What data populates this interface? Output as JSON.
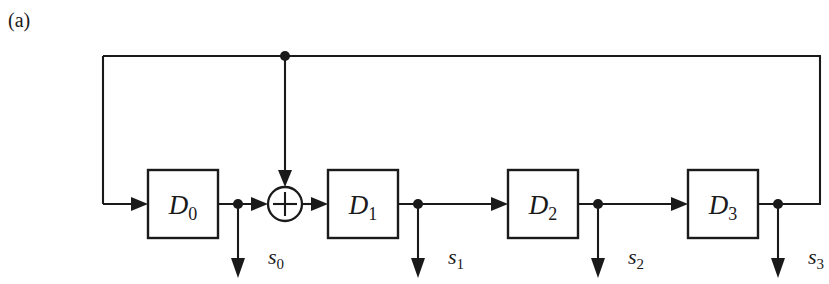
{
  "figure": {
    "caption": "(a)",
    "caption_x": 8,
    "caption_y": 10,
    "width": 829,
    "height": 284,
    "background": "#ffffff",
    "ink_color": "#1a1a1a",
    "type": "lfsr-shift-register-block-diagram"
  },
  "geometry": {
    "signal_line_y": 204,
    "feedback_line_y": 56,
    "feedback_left_x": 103,
    "feedback_right_x": 820,
    "tap_arrow_end_y": 276,
    "box_width": 70,
    "box_height": 68,
    "box_top_y": 170
  },
  "registers": [
    {
      "name": "D0",
      "letter": "D",
      "subscript": "0",
      "x": 148,
      "center_x": 183
    },
    {
      "name": "D1",
      "letter": "D",
      "subscript": "1",
      "x": 328,
      "center_x": 363
    },
    {
      "name": "D2",
      "letter": "D",
      "subscript": "2",
      "x": 508,
      "center_x": 543
    },
    {
      "name": "D3",
      "letter": "D",
      "subscript": "3",
      "x": 688,
      "center_x": 723
    }
  ],
  "xor_gate": {
    "name": "modulo-2-adder",
    "symbol": "circled-plus",
    "center_x": 285,
    "center_y": 204,
    "radius": 17
  },
  "taps": [
    {
      "name": "s0",
      "letter": "s",
      "subscript": "0",
      "junction_x": 238,
      "label_x": 268,
      "label_y": 264
    },
    {
      "name": "s1",
      "letter": "s",
      "subscript": "1",
      "junction_x": 418,
      "label_x": 448,
      "label_y": 264
    },
    {
      "name": "s2",
      "letter": "s",
      "subscript": "2",
      "junction_x": 598,
      "label_x": 628,
      "label_y": 264
    },
    {
      "name": "s3",
      "letter": "s",
      "subscript": "3",
      "junction_x": 778,
      "label_x": 808,
      "label_y": 264
    }
  ],
  "junction_dots": [
    {
      "name": "feedback-branch-dot",
      "x": 285,
      "y": 56
    },
    {
      "name": "tap-dot-s0",
      "x": 238,
      "y": 204
    },
    {
      "name": "tap-dot-s1",
      "x": 418,
      "y": 204
    },
    {
      "name": "tap-dot-s2",
      "x": 598,
      "y": 204
    },
    {
      "name": "tap-dot-s3",
      "x": 778,
      "y": 204
    }
  ]
}
